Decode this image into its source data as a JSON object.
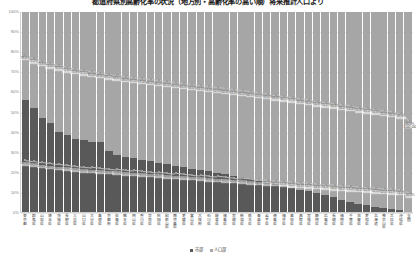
{
  "chart_data": {
    "type": "bar",
    "title": "都道府県別高齢化率の状況（地方別・高齢化率の高い順）将来推計人口より",
    "subtitle": "",
    "xlabel": "",
    "ylabel": "",
    "ylim": [
      0,
      100
    ],
    "ytick_labels": [
      "100%",
      "90%",
      "80%",
      "70%",
      "60%",
      "50%",
      "40%",
      "30%",
      "20%",
      "10%",
      "0%"
    ],
    "ytick_values": [
      100,
      90,
      80,
      70,
      60,
      50,
      40,
      30,
      20,
      10,
      0
    ],
    "grid": true,
    "stacked_percent": true,
    "legend_position": "bottom",
    "legend": [
      "市部",
      "人口部"
    ],
    "categories": [
      "東京都",
      "群馬県",
      "山梨県",
      "埼玉県",
      "茨城県",
      "長野県",
      "三重県",
      "山口県",
      "大分県",
      "島根県",
      "京都府",
      "佐賀県",
      "熊本県",
      "岡山県",
      "香川県",
      "奈良県",
      "秋田県",
      "和歌山県",
      "鹿児島県",
      "愛媛県",
      "富山県",
      "大阪府",
      "石川県",
      "岐阜県",
      "福島県",
      "宮崎県",
      "新潟県",
      "栃木県",
      "青森県",
      "岩手県",
      "徳島県",
      "福井県",
      "高知県",
      "鳥取県",
      "宮城県",
      "静岡県",
      "広島県",
      "長崎県",
      "福岡県",
      "千葉県",
      "滋賀県",
      "愛知県",
      "北海道",
      "神奈川県",
      "兵庫県",
      "沖縄県",
      "全国"
    ],
    "series": [
      {
        "name": "市部",
        "color": "#595959",
        "values": [
          56.1,
          52.0,
          47.2,
          44.7,
          40.2,
          38.5,
          36.3,
          35.9,
          35.2,
          34.8,
          30.3,
          28.7,
          27.6,
          26.8,
          26.0,
          25.4,
          24.7,
          24.0,
          23.2,
          22.5,
          21.7,
          21.0,
          20.3,
          19.5,
          18.8,
          18.0,
          17.2,
          16.4,
          15.6,
          14.7,
          13.9,
          13.0,
          12.1,
          11.2,
          10.3,
          9.3,
          8.3,
          7.3,
          6.2,
          5.1,
          4.0,
          3.3,
          2.7,
          2.1,
          1.6,
          1.1,
          0.0
        ]
      },
      {
        "name": "人口部",
        "color": "#a6a6a6",
        "values": [
          43.9,
          48.0,
          52.8,
          55.3,
          59.8,
          61.5,
          63.7,
          64.1,
          64.8,
          65.2,
          69.7,
          71.3,
          72.4,
          73.2,
          74.0,
          74.6,
          75.3,
          76.0,
          76.8,
          77.5,
          78.3,
          79.0,
          79.7,
          80.5,
          81.2,
          82.0,
          82.8,
          83.6,
          84.4,
          85.3,
          86.1,
          87.0,
          87.9,
          88.8,
          89.7,
          90.7,
          91.7,
          92.7,
          93.8,
          94.9,
          96.0,
          96.7,
          97.3,
          97.9,
          98.4,
          98.9,
          100.0
        ]
      }
    ],
    "upper_line": {
      "name": "上段ラベル",
      "values": [
        78.8,
        77.2,
        75.8,
        74.6,
        73.5,
        72.6,
        71.8,
        71.1,
        70.4,
        69.8,
        69.2,
        68.6,
        68.0,
        67.5,
        67.0,
        66.5,
        66.0,
        65.5,
        65.0,
        64.5,
        64.0,
        63.5,
        63.0,
        62.5,
        62.0,
        61.5,
        61.0,
        60.5,
        60.0,
        59.4,
        58.8,
        58.2,
        57.6,
        57.0,
        56.4,
        55.8,
        55.2,
        54.6,
        54.0,
        53.4,
        52.8,
        52.2,
        51.6,
        51.0,
        50.4,
        49.8,
        46.0
      ],
      "label_suffix": "%",
      "end_label": "100.00%"
    },
    "lower_line": {
      "name": "下段ラベル",
      "values": [
        26.5,
        25.8,
        25.2,
        24.7,
        24.2,
        23.8,
        23.4,
        23.0,
        22.7,
        22.4,
        22.1,
        21.8,
        21.5,
        21.2,
        20.9,
        20.6,
        20.3,
        20.0,
        19.7,
        19.4,
        19.1,
        18.8,
        18.5,
        18.2,
        17.9,
        17.6,
        17.3,
        17.0,
        16.7,
        16.4,
        16.1,
        15.8,
        15.5,
        15.2,
        14.9,
        14.6,
        14.3,
        14.0,
        13.7,
        13.4,
        13.1,
        12.8,
        12.5,
        12.2,
        11.9,
        11.6,
        10.5
      ],
      "label_suffix": "%"
    },
    "colors": {
      "series_dark": "#595959",
      "series_light": "#a6a6a6",
      "gridline": "#e6e6e6",
      "axis": "#d0d0d0",
      "label_line": "#bfbfbf",
      "label_text": "#6b6b6b"
    }
  }
}
